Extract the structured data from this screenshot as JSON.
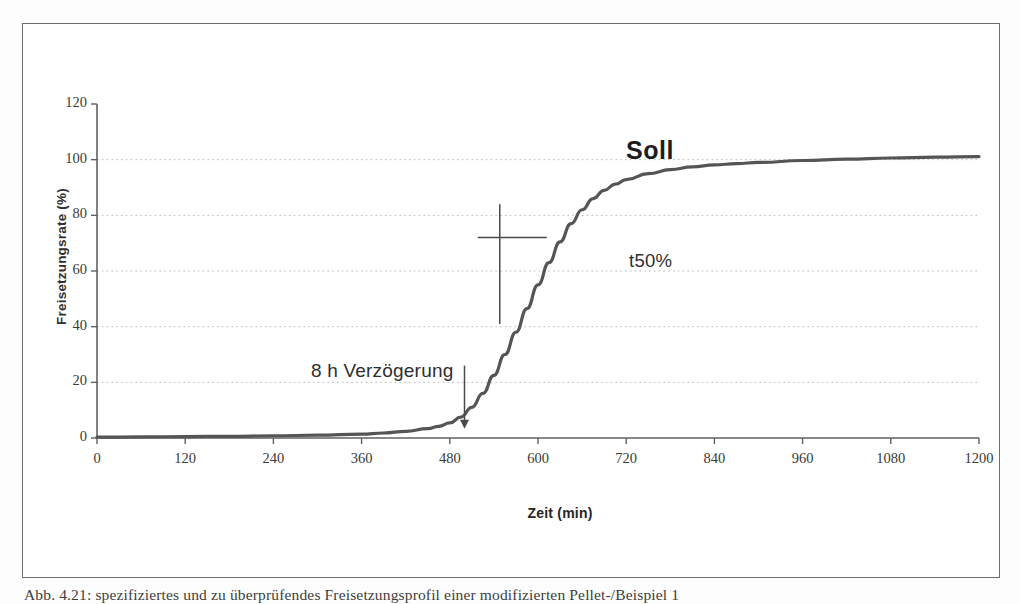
{
  "page": {
    "caption": "Abb. 4.21:  spezifiziertes und zu überprüfendes Freisetzungsprofil einer modifizierten Pellet-/Beispiel 1"
  },
  "figure": {
    "border_color": "#6e6e6e"
  },
  "chart_data": {
    "type": "line",
    "title": "",
    "xlabel": "Zeit (min)",
    "ylabel": "Freisetzungsrate (%)",
    "xlim": [
      0,
      1200
    ],
    "ylim": [
      0,
      120
    ],
    "xticks": [
      0,
      120,
      240,
      360,
      480,
      600,
      720,
      840,
      960,
      1080,
      1200
    ],
    "yticks": [
      0,
      20,
      40,
      60,
      80,
      100,
      120
    ],
    "grid": "horizontal-dotted",
    "gridlines_y": [
      20,
      40,
      60,
      80,
      100
    ],
    "legend": "none",
    "series": [
      {
        "name": "Soll",
        "color": "#555555",
        "x": [
          0,
          60,
          120,
          180,
          240,
          300,
          360,
          390,
          420,
          450,
          465,
          480,
          495,
          510,
          525,
          540,
          555,
          570,
          585,
          600,
          615,
          630,
          645,
          660,
          675,
          690,
          705,
          720,
          750,
          780,
          810,
          840,
          870,
          900,
          960,
          1020,
          1080,
          1140,
          1200
        ],
        "values": [
          0.3,
          0.4,
          0.5,
          0.6,
          0.8,
          1.0,
          1.4,
          1.8,
          2.4,
          3.4,
          4.2,
          5.4,
          7.5,
          11.0,
          16.0,
          22.5,
          30.0,
          38.0,
          46.5,
          55.0,
          63.0,
          70.5,
          77.0,
          82.0,
          86.0,
          89.0,
          91.2,
          92.8,
          95.0,
          96.4,
          97.4,
          98.1,
          98.6,
          99.0,
          99.7,
          100.2,
          100.6,
          100.9,
          101.1
        ]
      }
    ],
    "annotations": [
      {
        "id": "soll",
        "text": "Soll",
        "x": 760,
        "y": 112,
        "style": "bold"
      },
      {
        "id": "t50",
        "text": "t50%",
        "x": 700,
        "y": 73,
        "style": "plain"
      },
      {
        "id": "delay",
        "text": "8 h Verzögerung",
        "x": 300,
        "y": 36,
        "style": "plain"
      }
    ],
    "markers": [
      {
        "id": "t50-crosshair",
        "type": "cross",
        "x": 548,
        "y_top": 84,
        "y_bottom": 41,
        "y_bar": 72,
        "x_left": 518,
        "x_right": 612
      },
      {
        "id": "delay-arrow",
        "type": "arrow-down",
        "x": 500,
        "y_from": 26,
        "y_to": 4
      }
    ]
  }
}
